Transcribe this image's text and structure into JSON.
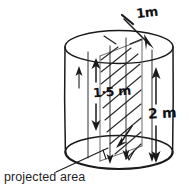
{
  "figure": {
    "kind": "engineering-sketch",
    "background_color": "#ffffff",
    "ink_color": "#1a1a1a"
  },
  "labels": {
    "top_length": "1m",
    "inner_height": "1·5 m",
    "total_height": "2 m",
    "caption": "projected area"
  },
  "annotations": {
    "top_arrow_name": "incoming-flow-arrow",
    "inner_dimension_name": "inner-height-dimension",
    "outer_dimension_name": "total-height-dimension",
    "leader_name": "projected-area-leader"
  },
  "geometry": {
    "top_ellipse_cx": 119,
    "top_ellipse_cy": 47,
    "top_ellipse_rx": 54,
    "top_ellipse_ry": 17,
    "bottom_ellipse_cx": 119,
    "bottom_ellipse_cy": 152,
    "bottom_ellipse_rx": 54,
    "bottom_ellipse_ry": 17
  }
}
